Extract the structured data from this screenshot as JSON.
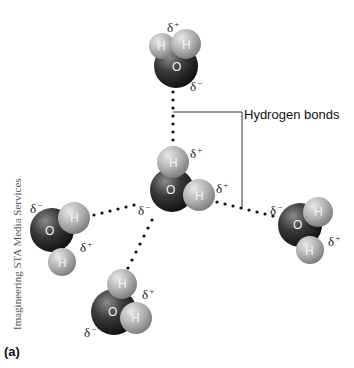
{
  "figure": {
    "panel_label": "(a)",
    "callout_label": "Hydrogen bonds",
    "credit": "Imagineering STA Media Services",
    "atom_labels": {
      "oxygen": "O",
      "hydrogen": "H"
    },
    "charges": {
      "positive": "δ",
      "positive_sign": "+",
      "negative": "δ",
      "negative_sign": "−"
    },
    "molecules": [
      {
        "id": "top",
        "charges": [
          "δ+",
          "δ−"
        ]
      },
      {
        "id": "center",
        "charges": [
          "δ+",
          "δ+",
          "δ−"
        ]
      },
      {
        "id": "left",
        "charges": [
          "δ−",
          "δ+"
        ]
      },
      {
        "id": "bottom",
        "charges": [
          "δ+",
          "δ−"
        ]
      },
      {
        "id": "right",
        "charges": [
          "δ−",
          "δ+"
        ]
      }
    ],
    "colors": {
      "oxygen": "#2a2a2a",
      "hydrogen": "#b8b8b8",
      "bond_dots": "#111111",
      "callout_line": "#333333"
    }
  }
}
